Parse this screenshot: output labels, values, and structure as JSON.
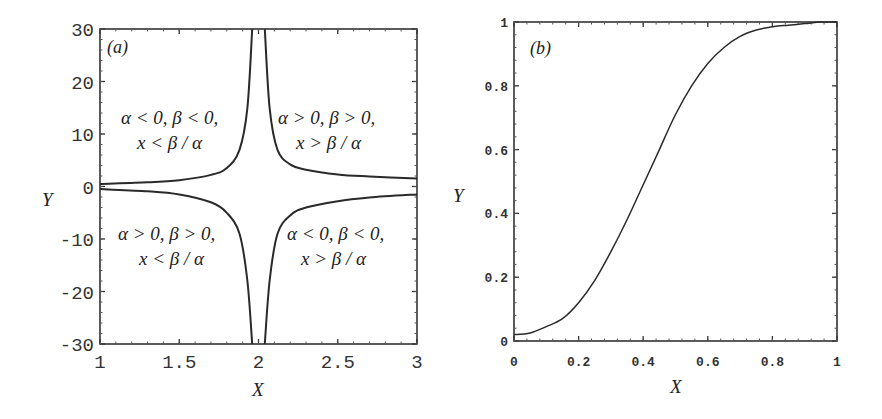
{
  "chart_data": [
    {
      "type": "line",
      "panel_label": "(a)",
      "title": "",
      "xlabel": "X",
      "ylabel": "Y",
      "xlim": [
        1,
        3
      ],
      "ylim": [
        -30,
        30
      ],
      "x_ticks": [
        "1",
        "1.5",
        "2",
        "2.5",
        "3"
      ],
      "y_ticks": [
        "30",
        "20",
        "10",
        "0",
        "-10",
        "-20",
        "-30"
      ],
      "grid": false,
      "series": [
        {
          "name": "upper-left branch",
          "x": [
            1.0,
            1.3,
            1.5,
            1.7,
            1.8,
            1.88,
            1.93,
            1.96
          ],
          "values": [
            0.5,
            0.8,
            1.2,
            2.2,
            3.5,
            7,
            15,
            30
          ]
        },
        {
          "name": "upper-right branch",
          "x": [
            2.04,
            2.07,
            2.12,
            2.2,
            2.3,
            2.5,
            2.7,
            3.0
          ],
          "values": [
            30,
            15,
            7,
            4.2,
            3.2,
            2.3,
            1.9,
            1.5
          ]
        },
        {
          "name": "lower-left branch",
          "x": [
            1.0,
            1.3,
            1.5,
            1.7,
            1.8,
            1.88,
            1.93,
            1.96
          ],
          "values": [
            -0.5,
            -0.9,
            -1.5,
            -3,
            -5,
            -9,
            -18,
            -30
          ]
        },
        {
          "name": "lower-right branch",
          "x": [
            2.04,
            2.07,
            2.12,
            2.2,
            2.3,
            2.5,
            2.7,
            3.0
          ],
          "values": [
            -30,
            -18,
            -9,
            -5.5,
            -4,
            -2.8,
            -2.1,
            -1.5
          ]
        }
      ],
      "annotations": [
        {
          "region": "upper-left",
          "line1": "α < 0, β < 0,",
          "line2": "x < β / α"
        },
        {
          "region": "upper-right",
          "line1": "α > 0, β > 0,",
          "line2": "x > β / α"
        },
        {
          "region": "lower-left",
          "line1": "α > 0, β > 0,",
          "line2": "x < β / α"
        },
        {
          "region": "lower-right",
          "line1": "α < 0, β < 0,",
          "line2": "x > β / α"
        }
      ]
    },
    {
      "type": "line",
      "panel_label": "(b)",
      "title": "",
      "xlabel": "X",
      "ylabel": "Y",
      "xlim": [
        0,
        1
      ],
      "ylim": [
        0,
        1
      ],
      "x_ticks": [
        "0",
        "0.2",
        "0.4",
        "0.6",
        "0.8",
        "1"
      ],
      "y_ticks": [
        "1",
        "0.8",
        "0.6",
        "0.4",
        "0.2",
        "0"
      ],
      "grid": false,
      "series": [
        {
          "name": "Y(X)",
          "x": [
            0.0,
            0.05,
            0.1,
            0.15,
            0.2,
            0.25,
            0.3,
            0.35,
            0.4,
            0.45,
            0.5,
            0.55,
            0.6,
            0.65,
            0.7,
            0.75,
            0.8,
            0.85,
            0.9,
            0.95,
            1.0
          ],
          "values": [
            0.02,
            0.025,
            0.045,
            0.07,
            0.12,
            0.19,
            0.28,
            0.38,
            0.49,
            0.6,
            0.71,
            0.8,
            0.87,
            0.92,
            0.955,
            0.975,
            0.985,
            0.99,
            0.995,
            1.0,
            1.0
          ]
        }
      ]
    }
  ]
}
